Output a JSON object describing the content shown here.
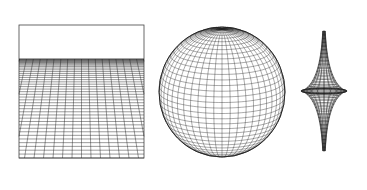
{
  "figure": {
    "panels": [
      {
        "id": "plane",
        "name": "Flat plane (zero curvature)",
        "label": "plane"
      },
      {
        "id": "sphere",
        "name": "Sphere (positive curvature)",
        "label": "sphere"
      },
      {
        "id": "pseudosphere",
        "name": "Pseudosphere (negative curvature)",
        "label": "pseudosphere"
      }
    ],
    "colors": {
      "background": "#ffffff",
      "line": "#222222",
      "frame": "#444444"
    }
  }
}
